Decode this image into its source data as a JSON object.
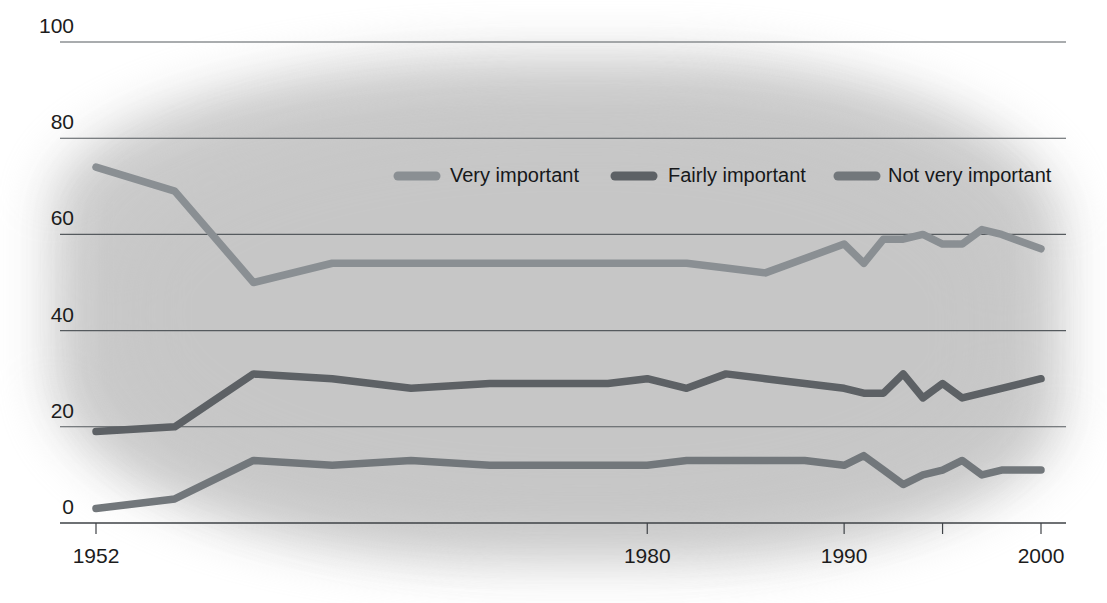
{
  "chart_data": {
    "type": "line",
    "title": "",
    "subtitle": "",
    "xlabel": "",
    "ylabel": "",
    "xlim": [
      1952,
      2000
    ],
    "ylim": [
      0,
      100
    ],
    "grid": true,
    "legend_position": "top-center",
    "y_ticks": [
      0,
      20,
      40,
      60,
      80,
      100
    ],
    "y_tick_labels": [
      "0",
      "20",
      "40",
      "60",
      "80",
      "100"
    ],
    "x_ticks": [
      1952,
      1980,
      1990,
      2000
    ],
    "x_tick_labels": [
      "1952",
      "1980",
      "1990",
      "2000"
    ],
    "x_unlabeled_ticks": [
      1995
    ],
    "series": [
      {
        "name": "Very important",
        "color": "#8a8f93",
        "x": [
          1952,
          1956,
          1960,
          1964,
          1968,
          1972,
          1974,
          1976,
          1978,
          1980,
          1982,
          1984,
          1986,
          1988,
          1990,
          1991,
          1992,
          1993,
          1994,
          1995,
          1996,
          1997,
          1998,
          2000
        ],
        "values": [
          74,
          69,
          50,
          54,
          54,
          54,
          54,
          54,
          54,
          54,
          54,
          53,
          52,
          55,
          58,
          54,
          59,
          59,
          60,
          58,
          58,
          61,
          60,
          57
        ]
      },
      {
        "name": "Fairly important",
        "color": "#5d6165",
        "x": [
          1952,
          1956,
          1960,
          1964,
          1968,
          1972,
          1974,
          1976,
          1978,
          1980,
          1982,
          1984,
          1986,
          1988,
          1990,
          1991,
          1992,
          1993,
          1994,
          1995,
          1996,
          1997,
          1998,
          2000
        ],
        "values": [
          19,
          20,
          31,
          30,
          28,
          29,
          29,
          29,
          29,
          30,
          28,
          31,
          30,
          29,
          28,
          27,
          27,
          31,
          26,
          29,
          26,
          27,
          28,
          30
        ]
      },
      {
        "name": "Not very important",
        "color": "#72777b",
        "x": [
          1952,
          1956,
          1960,
          1964,
          1968,
          1972,
          1974,
          1976,
          1978,
          1980,
          1982,
          1984,
          1986,
          1988,
          1990,
          1991,
          1992,
          1993,
          1994,
          1995,
          1996,
          1997,
          1998,
          2000
        ],
        "values": [
          3,
          5,
          13,
          12,
          13,
          12,
          12,
          12,
          12,
          12,
          13,
          13,
          13,
          13,
          12,
          14,
          11,
          8,
          10,
          11,
          13,
          10,
          11,
          11
        ]
      }
    ]
  },
  "legend": {
    "items": [
      {
        "label": "Very important",
        "color": "#8a8f93"
      },
      {
        "label": "Fairly important",
        "color": "#5d6165"
      },
      {
        "label": "Not very important",
        "color": "#72777b"
      }
    ]
  },
  "axes": {
    "y_labels": [
      "100",
      "80",
      "60",
      "40",
      "20",
      "0"
    ],
    "x_labels": [
      "1952",
      "1980",
      "1990",
      "2000"
    ]
  }
}
